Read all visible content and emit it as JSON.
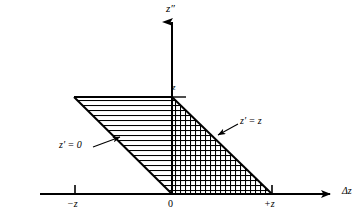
{
  "figure": {
    "name": "overlap-integration-region-diagram",
    "background": "#ffffff",
    "ink": "#000000",
    "width": 364,
    "height": 218
  },
  "axes": {
    "vertical": {
      "label": "z″",
      "label_name": "z-double-prime",
      "x": 172,
      "y_top": 18,
      "y_bottom": 194,
      "arrow": "up"
    },
    "horizontal": {
      "label": "Δz",
      "label_name": "delta-z",
      "y": 194,
      "x_left": 40,
      "x_right": 335,
      "arrow": "right"
    },
    "ticks": [
      {
        "label": "−z",
        "x": 75,
        "value": "-z"
      },
      {
        "label": "0",
        "x": 172,
        "value": "0"
      },
      {
        "label": "+z",
        "x": 272,
        "value": "+z"
      }
    ],
    "value_marks": [
      {
        "label": "z",
        "axis": "vertical",
        "y": 97
      }
    ]
  },
  "regions": [
    {
      "name": "horizontal-hatched-parallelogram",
      "hatch": "horizontal-lines",
      "hatch_spacing_px": 5,
      "vertices": [
        [
          74,
          97
        ],
        [
          172,
          97
        ],
        [
          272,
          194
        ],
        [
          172,
          194
        ]
      ]
    },
    {
      "name": "cross-hatched-triangle",
      "hatch": "grid",
      "hatch_spacing_px": 5,
      "vertices": [
        [
          172,
          97
        ],
        [
          272,
          194
        ],
        [
          172,
          194
        ]
      ]
    }
  ],
  "annotations": [
    {
      "name": "z-prime-equals-zero",
      "text": "z′ = 0",
      "x": 59,
      "y": 140,
      "leader_from": [
        93,
        147
      ],
      "leader_to": [
        122,
        136
      ]
    },
    {
      "name": "z-prime-equals-z",
      "text": "z′ = z",
      "x": 240,
      "y": 116,
      "leader_from": [
        238,
        124
      ],
      "leader_to": [
        216,
        136
      ]
    }
  ]
}
